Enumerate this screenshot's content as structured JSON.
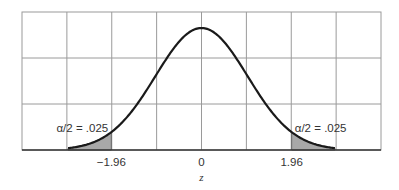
{
  "chart_data": {
    "type": "area",
    "title": "",
    "xlabel": "z",
    "ylabel": "",
    "xlim": [
      -3.9,
      3.9
    ],
    "grid": true,
    "series": [
      {
        "name": "standard normal density",
        "function": "normal_pdf",
        "mean": 0,
        "sd": 1,
        "domain": [
          -2.9,
          2.9
        ]
      }
    ],
    "shaded_regions": [
      {
        "name": "left-tail",
        "from": -2.9,
        "to": -1.96,
        "label": "α/2 = .025"
      },
      {
        "name": "right-tail",
        "from": 1.96,
        "to": 2.9,
        "label": "α/2 = .025"
      }
    ],
    "tick_labels": [
      {
        "value": -1.96,
        "label": "−1.96"
      },
      {
        "value": 0,
        "label": "0"
      },
      {
        "value": 1.96,
        "label": "1.96"
      }
    ],
    "annotations": [
      {
        "text": "α/2 = .025",
        "near": -1.96,
        "position": "above-left-tail"
      },
      {
        "text": "α/2 = .025",
        "near": 1.96,
        "position": "above-right-tail"
      }
    ],
    "colors": {
      "curve": "#1a1a1a",
      "shade": "#a8a8a8",
      "grid": "#9a9a9a"
    }
  }
}
